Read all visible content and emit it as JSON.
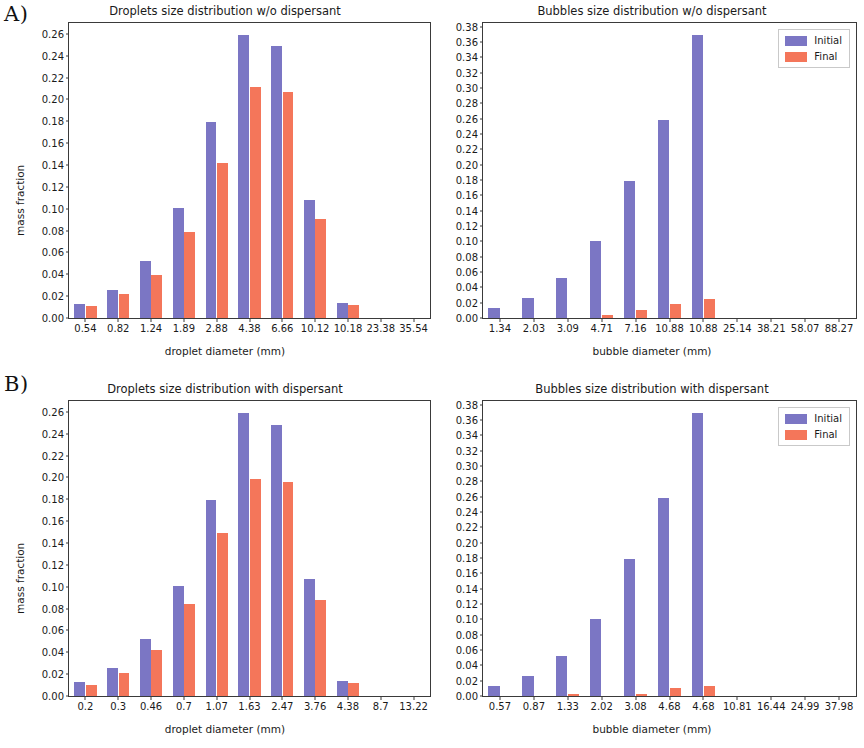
{
  "figure": {
    "panel_a_letter": "A)",
    "panel_b_letter": "B)"
  },
  "legend": {
    "initial_label": "Initial",
    "final_label": "Final",
    "initial_color": "#7b76c4",
    "final_color": "#f4765a"
  },
  "chart_data": [
    {
      "id": "droplets-no-dispersant",
      "panel": "A)",
      "type": "bar",
      "title": "Droplets size distribution w/o dispersant",
      "xlabel": "droplet diameter (mm)",
      "ylabel": "mass fraction",
      "categories": [
        "0.54",
        "0.82",
        "1.24",
        "1.89",
        "2.88",
        "4.38",
        "6.66",
        "10.12",
        "10.18",
        "23.38",
        "35.54"
      ],
      "series": [
        {
          "name": "Initial",
          "color": "#7b76c4",
          "values": [
            0.013,
            0.026,
            0.052,
            0.101,
            0.179,
            0.259,
            0.249,
            0.108,
            0.014,
            0.0,
            0.0
          ]
        },
        {
          "name": "Final",
          "color": "#f4765a",
          "values": [
            0.011,
            0.022,
            0.039,
            0.079,
            0.142,
            0.211,
            0.207,
            0.091,
            0.012,
            0.0,
            0.0
          ]
        }
      ],
      "ylim": [
        0.0,
        0.27
      ],
      "yticks": [
        "0.00",
        "0.02",
        "0.04",
        "0.06",
        "0.08",
        "0.10",
        "0.12",
        "0.14",
        "0.16",
        "0.18",
        "0.20",
        "0.22",
        "0.24",
        "0.26"
      ],
      "ytick_values": [
        0.0,
        0.02,
        0.04,
        0.06,
        0.08,
        0.1,
        0.12,
        0.14,
        0.16,
        0.18,
        0.2,
        0.22,
        0.24,
        0.26
      ],
      "grid": false,
      "legend_position": "none"
    },
    {
      "id": "bubbles-no-dispersant",
      "panel": "A)",
      "type": "bar",
      "title": "Bubbles size distribution w/o dispersant",
      "xlabel": "bubble diameter (mm)",
      "ylabel": "",
      "categories": [
        "1.34",
        "2.03",
        "3.09",
        "4.71",
        "7.16",
        "10.88",
        "10.88",
        "25.14",
        "38.21",
        "58.07",
        "88.27"
      ],
      "series": [
        {
          "name": "Initial",
          "color": "#7b76c4",
          "values": [
            0.013,
            0.026,
            0.052,
            0.101,
            0.179,
            0.259,
            0.37,
            0.0,
            0.0,
            0.0,
            0.0
          ]
        },
        {
          "name": "Final",
          "color": "#f4765a",
          "values": [
            0.0,
            0.0,
            0.0,
            0.004,
            0.011,
            0.018,
            0.025,
            0.0,
            0.0,
            0.0,
            0.0
          ]
        }
      ],
      "ylim": [
        0.0,
        0.385
      ],
      "yticks": [
        "0.00",
        "0.02",
        "0.04",
        "0.06",
        "0.08",
        "0.10",
        "0.12",
        "0.14",
        "0.16",
        "0.18",
        "0.20",
        "0.22",
        "0.24",
        "0.26",
        "0.28",
        "0.30",
        "0.32",
        "0.34",
        "0.36",
        "0.38"
      ],
      "ytick_values": [
        0.0,
        0.02,
        0.04,
        0.06,
        0.08,
        0.1,
        0.12,
        0.14,
        0.16,
        0.18,
        0.2,
        0.22,
        0.24,
        0.26,
        0.28,
        0.3,
        0.32,
        0.34,
        0.36,
        0.38
      ],
      "grid": false,
      "legend_position": "upper right"
    },
    {
      "id": "droplets-with-dispersant",
      "panel": "B)",
      "type": "bar",
      "title": "Droplets size distribution with dispersant",
      "xlabel": "droplet diameter (mm)",
      "ylabel": "mass fraction",
      "categories": [
        "0.2",
        "0.3",
        "0.46",
        "0.7",
        "1.07",
        "1.63",
        "2.47",
        "3.76",
        "4.38",
        "8.7",
        "13.22"
      ],
      "series": [
        {
          "name": "Initial",
          "color": "#7b76c4",
          "values": [
            0.013,
            0.026,
            0.052,
            0.101,
            0.179,
            0.259,
            0.248,
            0.107,
            0.014,
            0.0,
            0.0
          ]
        },
        {
          "name": "Final",
          "color": "#f4765a",
          "values": [
            0.01,
            0.021,
            0.042,
            0.084,
            0.149,
            0.199,
            0.196,
            0.088,
            0.012,
            0.0,
            0.0
          ]
        }
      ],
      "ylim": [
        0.0,
        0.27
      ],
      "yticks": [
        "0.00",
        "0.02",
        "0.04",
        "0.06",
        "0.08",
        "0.10",
        "0.12",
        "0.14",
        "0.16",
        "0.18",
        "0.20",
        "0.22",
        "0.24",
        "0.26"
      ],
      "ytick_values": [
        0.0,
        0.02,
        0.04,
        0.06,
        0.08,
        0.1,
        0.12,
        0.14,
        0.16,
        0.18,
        0.2,
        0.22,
        0.24,
        0.26
      ],
      "grid": false,
      "legend_position": "none"
    },
    {
      "id": "bubbles-with-dispersant",
      "panel": "B)",
      "type": "bar",
      "title": "Bubbles size distribution with dispersant",
      "xlabel": "bubble diameter (mm)",
      "ylabel": "",
      "categories": [
        "0.57",
        "0.87",
        "1.33",
        "2.02",
        "3.08",
        "4.68",
        "4.68",
        "10.81",
        "16.44",
        "24.99",
        "37.98"
      ],
      "series": [
        {
          "name": "Initial",
          "color": "#7b76c4",
          "values": [
            0.013,
            0.026,
            0.052,
            0.101,
            0.179,
            0.259,
            0.37,
            0.0,
            0.0,
            0.0,
            0.0
          ]
        },
        {
          "name": "Final",
          "color": "#f4765a",
          "values": [
            0.0,
            0.0,
            0.003,
            0.0,
            0.003,
            0.01,
            0.013,
            0.0,
            0.0,
            0.0,
            0.0
          ]
        }
      ],
      "ylim": [
        0.0,
        0.385
      ],
      "yticks": [
        "0.00",
        "0.02",
        "0.04",
        "0.06",
        "0.08",
        "0.10",
        "0.12",
        "0.14",
        "0.16",
        "0.18",
        "0.20",
        "0.22",
        "0.24",
        "0.26",
        "0.28",
        "0.30",
        "0.32",
        "0.34",
        "0.36",
        "0.38"
      ],
      "ytick_values": [
        0.0,
        0.02,
        0.04,
        0.06,
        0.08,
        0.1,
        0.12,
        0.14,
        0.16,
        0.18,
        0.2,
        0.22,
        0.24,
        0.26,
        0.28,
        0.3,
        0.32,
        0.34,
        0.36,
        0.38
      ],
      "grid": false,
      "legend_position": "upper right"
    }
  ]
}
